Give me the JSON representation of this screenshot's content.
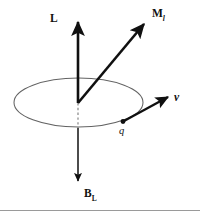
{
  "figure": {
    "kind": "physics-vector-diagram",
    "background_color": "#ffffff",
    "line_color": "#101010",
    "orbit_color": "#636363",
    "rule_color": "#9a9a9a",
    "labels": {
      "angular_momentum": "L",
      "magnetic_moment_base": "M",
      "magnetic_moment_subscript": "l",
      "velocity": "v",
      "charge": "q",
      "field_base": "B",
      "field_subscript": "L"
    },
    "geometry": {
      "origin": {
        "x": 78,
        "y": 103
      },
      "orbit_ellipse": {
        "cx": 78.5,
        "cy": 102.5,
        "rx": 64.5,
        "ry": 24.5
      },
      "vector_L": {
        "x1": 78,
        "y1": 103,
        "x2": 78,
        "y2": 19
      },
      "vector_M": {
        "x1": 78,
        "y1": 103,
        "x2": 147,
        "y2": 21
      },
      "vector_v": {
        "x1": 123,
        "y1": 122,
        "x2": 171,
        "y2": 95
      },
      "vector_BL": {
        "x1": 78,
        "y1": 127,
        "x2": 78,
        "y2": 184
      },
      "dashed_axis": {
        "x1": 78,
        "y1": 103,
        "x2": 78,
        "y2": 127
      },
      "charge_point": {
        "cx": 123,
        "cy": 121.5,
        "r": 2.3
      },
      "bottom_rule_y": 210
    }
  }
}
